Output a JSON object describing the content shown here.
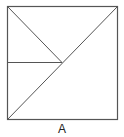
{
  "figure": {
    "label": "A",
    "stroke_color": "#555555",
    "square": {
      "x1": 7,
      "y1": 6,
      "x2": 117,
      "y2": 119
    },
    "lines": [
      {
        "name": "diagonal-main",
        "x1": 7,
        "y1": 119,
        "x2": 117,
        "y2": 6
      },
      {
        "name": "diagonal-top-left",
        "x1": 7,
        "y1": 6,
        "x2": 62,
        "y2": 62
      },
      {
        "name": "horizontal-mid",
        "x1": 7,
        "y1": 62,
        "x2": 62,
        "y2": 62
      }
    ]
  }
}
